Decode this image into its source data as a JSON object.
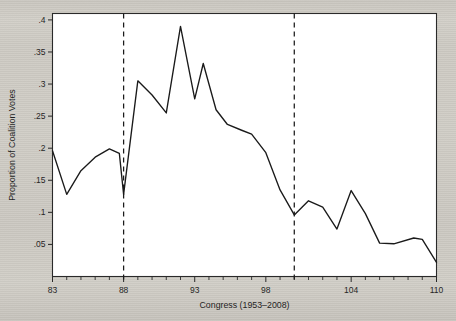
{
  "chart_data": {
    "type": "line",
    "title": "",
    "xlabel": "Congress (1953–2008)",
    "ylabel": "Proportion of Coalition Votes",
    "xlim": [
      83,
      110
    ],
    "ylim": [
      0.0,
      0.41
    ],
    "grid": false,
    "legend": "none",
    "x_tick_labels": [
      "83",
      "88",
      "93",
      "98",
      "104",
      "110"
    ],
    "x_tick_values": [
      83,
      88,
      93,
      98,
      104,
      110
    ],
    "x_minor_ticks": [
      83,
      84,
      85,
      86,
      87,
      88,
      89,
      90,
      91,
      92,
      93,
      94,
      95,
      96,
      97,
      98,
      99,
      100,
      101,
      102,
      103,
      104,
      105,
      106,
      107,
      108,
      109,
      110
    ],
    "y_tick_labels": [
      ".05",
      ".1",
      ".15",
      ".2",
      ".25",
      ".3",
      ".35",
      ".4"
    ],
    "y_tick_values": [
      0.05,
      0.1,
      0.15,
      0.2,
      0.25,
      0.3,
      0.35,
      0.4
    ],
    "annotations": [
      {
        "type": "vline",
        "name": "dashed-line-88",
        "x": 88,
        "style": "dashed"
      },
      {
        "type": "vline",
        "name": "dashed-line-100",
        "x": 100,
        "style": "dashed"
      }
    ],
    "x": [
      83,
      84,
      85,
      86,
      87,
      88,
      89,
      90,
      91,
      92,
      93,
      94,
      95,
      96,
      97,
      98,
      99,
      100,
      101,
      102,
      103,
      104,
      105,
      106,
      107,
      108,
      109,
      110
    ],
    "values": [
      0.196,
      0.128,
      0.165,
      0.186,
      0.199,
      0.192,
      0.128,
      0.305,
      0.283,
      0.255,
      0.39,
      0.277,
      0.332,
      0.26,
      0.237,
      0.228,
      0.222,
      0.193,
      0.135,
      0.096,
      0.118,
      0.108,
      0.074,
      0.134,
      0.098,
      0.052,
      0.051,
      0.06
    ],
    "series": [
      {
        "name": "Proportion of Coalition Votes",
        "color": "#1a1a1a",
        "points": [
          {
            "x": 83,
            "y": 0.196
          },
          {
            "x": 84,
            "y": 0.128
          },
          {
            "x": 85,
            "y": 0.165
          },
          {
            "x": 86,
            "y": 0.186
          },
          {
            "x": 87,
            "y": 0.199
          },
          {
            "x": 87.7,
            "y": 0.192
          },
          {
            "x": 88,
            "y": 0.128
          },
          {
            "x": 89,
            "y": 0.305
          },
          {
            "x": 90,
            "y": 0.283
          },
          {
            "x": 91,
            "y": 0.255
          },
          {
            "x": 92,
            "y": 0.39
          },
          {
            "x": 93,
            "y": 0.277
          },
          {
            "x": 93.6,
            "y": 0.332
          },
          {
            "x": 94.5,
            "y": 0.26
          },
          {
            "x": 95.3,
            "y": 0.237
          },
          {
            "x": 96.3,
            "y": 0.228
          },
          {
            "x": 97,
            "y": 0.222
          },
          {
            "x": 98,
            "y": 0.193
          },
          {
            "x": 99,
            "y": 0.135
          },
          {
            "x": 100,
            "y": 0.096
          },
          {
            "x": 101,
            "y": 0.118
          },
          {
            "x": 102,
            "y": 0.108
          },
          {
            "x": 103,
            "y": 0.074
          },
          {
            "x": 104,
            "y": 0.134
          },
          {
            "x": 105,
            "y": 0.098
          },
          {
            "x": 106,
            "y": 0.052
          },
          {
            "x": 107,
            "y": 0.051
          },
          {
            "x": 108.4,
            "y": 0.06
          },
          {
            "x": 109,
            "y": 0.058
          },
          {
            "x": 110,
            "y": 0.022
          }
        ]
      }
    ]
  },
  "figure": {
    "colors": {
      "line": "#1a1a1a",
      "axis": "#2a2a2a",
      "plot_background": "#ffffff",
      "page_background": "#cfccc6"
    }
  }
}
